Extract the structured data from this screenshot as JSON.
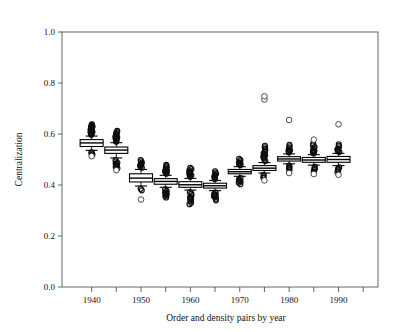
{
  "chart_data": {
    "type": "box",
    "title": "",
    "xlabel": "Order and density pairs by year",
    "ylabel": "Centralization",
    "ylim": [
      0.0,
      1.0
    ],
    "xlim": [
      1934,
      1998
    ],
    "grid": false,
    "legend": null,
    "y_ticks": [
      "0.0",
      "0.2",
      "0.4",
      "0.6",
      "0.8",
      "1.0"
    ],
    "y_tick_values": [
      0.0,
      0.2,
      0.4,
      0.6,
      0.8,
      1.0
    ],
    "x_ticks": [
      "1940",
      "1950",
      "1960",
      "1970",
      "1980",
      "1990"
    ],
    "x_tick_values": [
      1940,
      1950,
      1960,
      1970,
      1980,
      1990
    ],
    "x_minor_tick_values": [
      1945,
      1955,
      1965,
      1975,
      1985,
      1995
    ],
    "boxes": [
      {
        "label": "1940",
        "x": 1940,
        "median": 0.565,
        "q1": 0.551,
        "q3": 0.578,
        "whisker_low": 0.536,
        "whisker_high": 0.592,
        "outliers_high": [
          0.597,
          0.601,
          0.604,
          0.608,
          0.611,
          0.615,
          0.618,
          0.622,
          0.625,
          0.629,
          0.632,
          0.635,
          0.638,
          0.627,
          0.62,
          0.613,
          0.606,
          0.599
        ],
        "outliers_low": [
          0.528,
          0.524,
          0.519
        ],
        "outliers_open_low": [
          0.513
        ]
      },
      {
        "label": "1945",
        "x": 1945,
        "median": 0.537,
        "q1": 0.524,
        "q3": 0.549,
        "whisker_low": 0.506,
        "whisker_high": 0.566,
        "outliers_high": [
          0.572,
          0.576,
          0.58,
          0.584,
          0.588,
          0.592,
          0.596,
          0.6,
          0.604,
          0.608,
          0.612,
          0.586,
          0.578,
          0.57
        ],
        "outliers_low": [
          0.498,
          0.492,
          0.487,
          0.481,
          0.476,
          0.471,
          0.466,
          0.484,
          0.479
        ],
        "outliers_open_low": [
          0.458
        ]
      },
      {
        "label": "1950",
        "x": 1950,
        "median": 0.427,
        "q1": 0.412,
        "q3": 0.444,
        "whisker_low": 0.396,
        "whisker_high": 0.461,
        "outliers_high": [
          0.468,
          0.473,
          0.478,
          0.483,
          0.488,
          0.493,
          0.498,
          0.481,
          0.475
        ],
        "outliers_low": [
          0.385,
          0.379
        ],
        "outliers_open_low": [
          0.343
        ]
      },
      {
        "label": "1955",
        "x": 1955,
        "median": 0.414,
        "q1": 0.403,
        "q3": 0.425,
        "whisker_low": 0.391,
        "whisker_high": 0.438,
        "outliers_high": [
          0.444,
          0.449,
          0.454,
          0.459,
          0.464,
          0.469,
          0.474,
          0.479,
          0.457,
          0.451
        ],
        "outliers_low": [
          0.383,
          0.377,
          0.371,
          0.366,
          0.361,
          0.356,
          0.351,
          0.369,
          0.363
        ],
        "outliers_open_low": []
      },
      {
        "label": "1960",
        "x": 1960,
        "median": 0.401,
        "q1": 0.391,
        "q3": 0.413,
        "whisker_low": 0.38,
        "whisker_high": 0.426,
        "outliers_high": [
          0.432,
          0.437,
          0.442,
          0.447,
          0.452,
          0.457,
          0.462,
          0.467,
          0.445,
          0.438
        ],
        "outliers_low": [
          0.372,
          0.366,
          0.36,
          0.354,
          0.348,
          0.342,
          0.336,
          0.33,
          0.325,
          0.35,
          0.344
        ],
        "outliers_open_low": []
      },
      {
        "label": "1965",
        "x": 1965,
        "median": 0.397,
        "q1": 0.388,
        "q3": 0.407,
        "whisker_low": 0.378,
        "whisker_high": 0.418,
        "outliers_high": [
          0.424,
          0.429,
          0.434,
          0.439,
          0.444,
          0.449,
          0.454,
          0.436,
          0.43
        ],
        "outliers_low": [
          0.37,
          0.364,
          0.358,
          0.352,
          0.346,
          0.34,
          0.362,
          0.356
        ],
        "outliers_open_low": []
      },
      {
        "label": "1970",
        "x": 1970,
        "median": 0.452,
        "q1": 0.444,
        "q3": 0.461,
        "whisker_low": 0.434,
        "whisker_high": 0.472,
        "outliers_high": [
          0.478,
          0.483,
          0.488,
          0.493,
          0.498,
          0.503,
          0.486,
          0.48
        ],
        "outliers_low": [
          0.427,
          0.421,
          0.415,
          0.409,
          0.403,
          0.419,
          0.413
        ],
        "outliers_open_low": []
      },
      {
        "label": "1975",
        "x": 1975,
        "median": 0.466,
        "q1": 0.457,
        "q3": 0.476,
        "whisker_low": 0.447,
        "whisker_high": 0.488,
        "outliers_high": [
          0.494,
          0.5,
          0.506,
          0.512,
          0.518,
          0.524,
          0.53,
          0.536,
          0.542,
          0.548,
          0.554,
          0.516,
          0.508
        ],
        "outliers_low": [
          0.44,
          0.434,
          0.428
        ],
        "outliers_open_high": [
          0.735,
          0.748
        ],
        "outliers_open_low": [
          0.418
        ]
      },
      {
        "label": "1980",
        "x": 1980,
        "median": 0.502,
        "q1": 0.494,
        "q3": 0.511,
        "whisker_low": 0.483,
        "whisker_high": 0.522,
        "outliers_high": [
          0.528,
          0.534,
          0.54,
          0.546,
          0.552,
          0.558,
          0.536,
          0.53
        ],
        "outliers_low": [
          0.476,
          0.47,
          0.464,
          0.458,
          0.468
        ],
        "outliers_open_high": [
          0.655
        ],
        "outliers_open_low": [
          0.447
        ]
      },
      {
        "label": "1985",
        "x": 1985,
        "median": 0.498,
        "q1": 0.489,
        "q3": 0.508,
        "whisker_low": 0.478,
        "whisker_high": 0.519,
        "outliers_high": [
          0.525,
          0.531,
          0.537,
          0.543,
          0.549,
          0.555,
          0.561,
          0.533,
          0.527
        ],
        "outliers_low": [
          0.471,
          0.465,
          0.459,
          0.453,
          0.463
        ],
        "outliers_open_high": [
          0.578
        ],
        "outliers_open_low": [
          0.443
        ]
      },
      {
        "label": "1990",
        "x": 1990,
        "median": 0.5,
        "q1": 0.489,
        "q3": 0.512,
        "whisker_low": 0.476,
        "whisker_high": 0.524,
        "outliers_high": [
          0.53,
          0.536,
          0.542,
          0.548,
          0.554,
          0.56,
          0.538,
          0.532
        ],
        "outliers_low": [
          0.469,
          0.463,
          0.457,
          0.451,
          0.461
        ],
        "outliers_open_high": [
          0.638
        ],
        "outliers_open_low": [
          0.44
        ]
      }
    ]
  }
}
